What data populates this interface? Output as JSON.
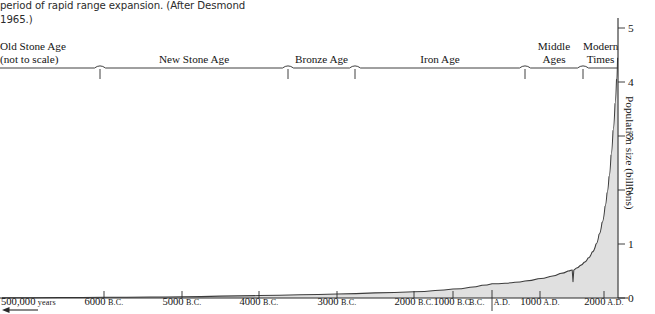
{
  "caption": {
    "text": "period of rapid range expansion. (After Desmond 1965.)"
  },
  "eras": [
    {
      "label": "Old Stone Age\n(not to scale)",
      "start": 0,
      "end": 100
    },
    {
      "label": "New Stone Age",
      "start": 100,
      "end": 288
    },
    {
      "label": "Bronze Age",
      "start": 288,
      "end": 355
    },
    {
      "label": "Iron Age",
      "start": 355,
      "end": 525
    },
    {
      "label": "Middle\nAges",
      "start": 525,
      "end": 583
    },
    {
      "label": "Modern\nTimes",
      "start": 583,
      "end": 618
    }
  ],
  "yaxis": {
    "title": "Population size (billions)",
    "ticks": [
      "5",
      "4",
      "3",
      "2",
      "1",
      "0"
    ]
  },
  "xaxis": {
    "labels": [
      {
        "main": "500,000",
        "small": " years",
        "x": 1,
        "first": true
      },
      {
        "main": "6000",
        "small": "B.C.",
        "x": 104
      },
      {
        "main": "5000",
        "small": "B.C.",
        "x": 182
      },
      {
        "main": "4000",
        "small": "B.C.",
        "x": 259
      },
      {
        "main": "3000",
        "small": "B.C.",
        "x": 337
      },
      {
        "main": "2000",
        "small": "B.C.",
        "x": 414
      },
      {
        "main": "1000",
        "small": "B.C.",
        "x": 453
      },
      {
        "main": "B.C.",
        "small": "",
        "x": 492,
        "bcad": true
      },
      {
        "main": "1000",
        "small": "A.D.",
        "x": 540
      },
      {
        "main": "2000",
        "small": "A.D.",
        "x": 604
      }
    ]
  },
  "chart_data": {
    "type": "area",
    "title": "",
    "xlabel": "",
    "ylabel": "Population size (billions)",
    "ylim": [
      0,
      5
    ],
    "grid": false,
    "legend": "none",
    "annotations": [
      "Old Stone Age portion of x-axis is not to scale",
      "Sharp dip near 1350 A.D. (Black Death / plague)"
    ],
    "x_tick_labels": [
      "500,000 years",
      "6000 B.C.",
      "5000 B.C.",
      "4000 B.C.",
      "3000 B.C.",
      "2000 B.C.",
      "1000 B.C.",
      "B.C. | A.D.",
      "1000 A.D.",
      "2000 A.D."
    ],
    "y_tick_labels": [
      "0",
      "1",
      "2",
      "3",
      "4",
      "5"
    ],
    "series": [
      {
        "name": "World population",
        "x": [
          "500,000 B.C.",
          "6000 B.C.",
          "5000 B.C.",
          "4000 B.C.",
          "3000 B.C.",
          "2000 B.C.",
          "1000 B.C.",
          "1 A.D.",
          "500 A.D.",
          "1000 A.D.",
          "1250 A.D.",
          "1350 A.D.",
          "1400 A.D.",
          "1500 A.D.",
          "1650 A.D.",
          "1750 A.D.",
          "1850 A.D.",
          "1900 A.D.",
          "1930 A.D.",
          "1960 A.D.",
          "1975 A.D.",
          "1990 A.D.",
          "2000 A.D."
        ],
        "values": [
          0.0,
          0.01,
          0.02,
          0.03,
          0.05,
          0.07,
          0.1,
          0.17,
          0.19,
          0.27,
          0.4,
          0.43,
          0.35,
          0.45,
          0.55,
          0.79,
          1.2,
          1.6,
          2.0,
          3.0,
          4.0,
          5.3,
          6.0
        ]
      }
    ]
  },
  "colors": {
    "curve": "#3d3d3d",
    "fill": "#dedede",
    "axis": "#2a2a2a",
    "text": "#141414"
  }
}
